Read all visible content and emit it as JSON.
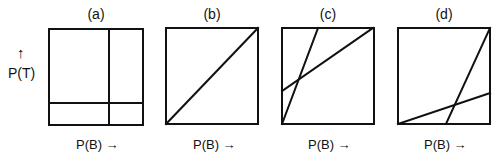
{
  "y_axis": {
    "arrow": "↑",
    "label": "P(T)"
  },
  "panels": [
    {
      "id": "a",
      "label": "(a)",
      "x_axis": "P(B) →"
    },
    {
      "id": "b",
      "label": "(b)",
      "x_axis": "P(B) →"
    },
    {
      "id": "c",
      "label": "(c)",
      "x_axis": "P(B) →"
    },
    {
      "id": "d",
      "label": "(d)",
      "x_axis": "P(B) →"
    }
  ],
  "colors": {
    "stroke": "#111111",
    "background": "#ffffff"
  }
}
